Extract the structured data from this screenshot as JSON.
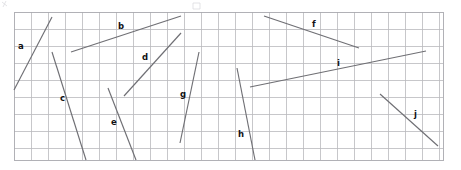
{
  "figure": {
    "background_color": "#ffffff",
    "grid": {
      "x": 14,
      "y": 12,
      "width": 429,
      "height": 148,
      "cell_size": 17,
      "columns": 25,
      "rows": 8.7,
      "line_color": "#b9b9bd",
      "border_color": "#a9a9ae"
    },
    "segment_style": {
      "color": "#6f6f74",
      "width": 1.15
    },
    "label_style": {
      "color": "#111114",
      "size": 8.5,
      "weight": "bold"
    },
    "segments": [
      {
        "label": "a",
        "x1": 14,
        "y1": 90,
        "x2": 52,
        "y2": 17,
        "label_x": 18,
        "label_y": 49,
        "direction": "rising-steep"
      },
      {
        "label": "b",
        "x1": 71,
        "y1": 52,
        "x2": 181,
        "y2": 16,
        "label_x": 118,
        "label_y": 29,
        "direction": "rising-shallow"
      },
      {
        "label": "c",
        "x1": 52,
        "y1": 52,
        "x2": 86,
        "y2": 160,
        "label_x": 60,
        "label_y": 101,
        "direction": "falling-steep"
      },
      {
        "label": "d",
        "x1": 124,
        "y1": 96,
        "x2": 181,
        "y2": 33,
        "label_x": 142,
        "label_y": 60,
        "direction": "rising-steep"
      },
      {
        "label": "e",
        "x1": 108,
        "y1": 88,
        "x2": 136,
        "y2": 160,
        "label_x": 111,
        "label_y": 125,
        "direction": "falling-steep"
      },
      {
        "label": "f",
        "x1": 264,
        "y1": 16,
        "x2": 359,
        "y2": 48,
        "label_x": 312,
        "label_y": 27,
        "direction": "falling-shallow"
      },
      {
        "label": "g",
        "x1": 180,
        "y1": 143,
        "x2": 199,
        "y2": 52,
        "label_x": 180,
        "label_y": 97,
        "direction": "rising-steep"
      },
      {
        "label": "h",
        "x1": 237,
        "y1": 68,
        "x2": 255,
        "y2": 160,
        "label_x": 238,
        "label_y": 137,
        "direction": "falling-steep"
      },
      {
        "label": "i",
        "x1": 250,
        "y1": 87,
        "x2": 426,
        "y2": 51,
        "label_x": 337,
        "label_y": 66,
        "direction": "rising-shallow"
      },
      {
        "label": "j",
        "x1": 380,
        "y1": 94,
        "x2": 438,
        "y2": 146,
        "label_x": 414,
        "label_y": 117,
        "direction": "falling-medium"
      }
    ]
  }
}
